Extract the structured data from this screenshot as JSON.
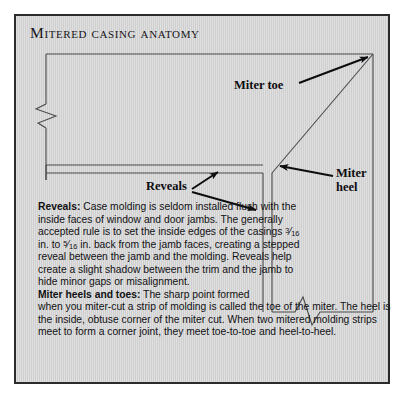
{
  "figure": {
    "title": "Mitered casing anatomy",
    "border_color": "#2b2b2b",
    "panel_color": "#d2d2d2",
    "line_color": "#4a4a4a",
    "arrow_color": "#0d0d10"
  },
  "callouts": {
    "miter_toe": "Miter toe",
    "miter_heel_line1": "Miter",
    "miter_heel_line2": "heel",
    "reveals": "Reveals"
  },
  "body": {
    "reveals_lead": "Reveals:",
    "reveals_text_a": " Case molding is seldom installed flush with the inside faces of window and door jambs. The generally accepted rule is to set the inside edges of the casings ",
    "reveals_frac_1_num": "3",
    "reveals_frac_1_den": "16",
    "reveals_text_b": " in. to ",
    "reveals_frac_2_num": "5",
    "reveals_frac_2_den": "16",
    "reveals_text_c": " in. back from the jamb faces, creating a stepped reveal between the jamb and the molding. Reveals help create a slight shadow between the trim and the jamb to hide minor gaps or misalignment.",
    "miter_lead": "Miter heels and toes:",
    "miter_text_first": " The sharp point formed",
    "miter_text_rest": "when you miter-cut a strip of molding is called the toe of the miter. The heel is the inside, obtuse corner of the miter cut. When two mitered molding strips meet to form a corner joint, they meet toe-to-toe and heel-to-heel."
  }
}
